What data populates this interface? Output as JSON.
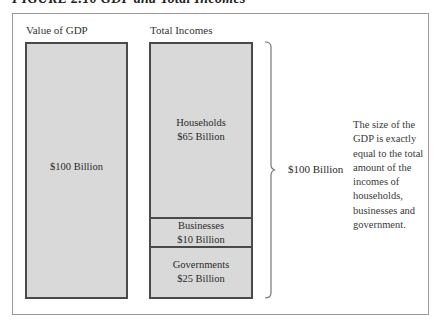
{
  "figure": {
    "title": "FIGURE 2.10  GDP and Total Incomes"
  },
  "columns": {
    "left": {
      "label": "Value of GDP",
      "value": "$100 Billion"
    },
    "right": {
      "label": "Total Incomes",
      "segments": [
        {
          "name": "Households",
          "value": "$65 Billion",
          "share": 65
        },
        {
          "name": "Businesses",
          "value": "$10 Billion",
          "share": 10
        },
        {
          "name": "Governments",
          "value": "$25 Billion",
          "share": 25
        }
      ]
    }
  },
  "brace": {
    "label": "$100 Billion"
  },
  "description": "The size of the GDP is exactly equal to the total amount of the incomes of households, businesses and government.",
  "colors": {
    "box_fill": "#d9d9d9",
    "box_border": "#4a4a4a",
    "frame_border": "#9a9a9a"
  }
}
